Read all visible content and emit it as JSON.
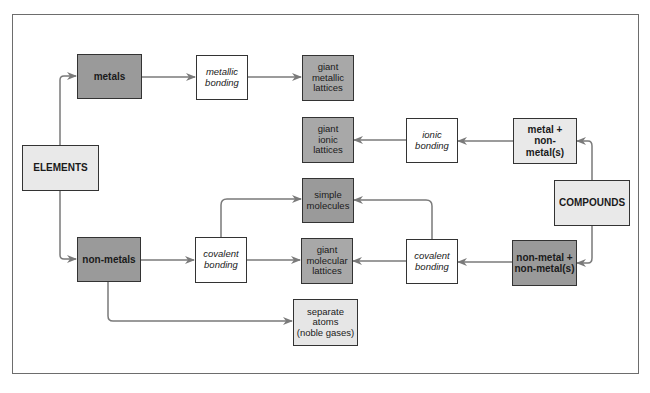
{
  "diagram": {
    "nodes": {
      "elements": {
        "label": "ELEMENTS",
        "style": "bold-caps"
      },
      "compounds": {
        "label": "COMPOUNDS",
        "style": "bold-caps"
      },
      "metals": {
        "label": "metals"
      },
      "non_metals": {
        "label": "non-metals"
      },
      "metallic_bonding": {
        "line1": "metallic",
        "line2": "bonding"
      },
      "giant_metallic_lattices": {
        "line1": "giant",
        "line2": "metallic",
        "line3": "lattices"
      },
      "giant_ionic_lattices": {
        "line1": "giant",
        "line2": "ionic",
        "line3": "lattices"
      },
      "ionic_bonding": {
        "line1": "ionic",
        "line2": "bonding"
      },
      "metal_nonmetal": {
        "line1": "metal +",
        "line2": "non-",
        "line3": "metal(s)"
      },
      "simple_molecules": {
        "line1": "simple",
        "line2": "molecules"
      },
      "covalent_bonding_left": {
        "line1": "covalent",
        "line2": "bonding"
      },
      "giant_molecular_lattices": {
        "line1": "giant",
        "line2": "molecular",
        "line3": "lattices"
      },
      "covalent_bonding_right": {
        "line1": "covalent",
        "line2": "bonding"
      },
      "nonmetal_nonmetal": {
        "line1": "non-metal +",
        "line2": "non-metal(s)"
      },
      "separate_atoms": {
        "line1": "separate",
        "line2": "atoms",
        "line3": "(noble gases)"
      }
    },
    "edges": [
      {
        "from": "ELEMENTS",
        "to": "metals"
      },
      {
        "from": "ELEMENTS",
        "to": "non-metals"
      },
      {
        "from": "metals",
        "to": "metallic bonding"
      },
      {
        "from": "metallic bonding",
        "to": "giant metallic lattices"
      },
      {
        "from": "COMPOUNDS",
        "to": "metal + non-metal(s)"
      },
      {
        "from": "COMPOUNDS",
        "to": "non-metal + non-metal(s)"
      },
      {
        "from": "metal + non-metal(s)",
        "to": "ionic bonding"
      },
      {
        "from": "ionic bonding",
        "to": "giant ionic lattices"
      },
      {
        "from": "non-metals",
        "to": "covalent bonding"
      },
      {
        "from": "covalent bonding",
        "to": "simple molecules"
      },
      {
        "from": "covalent bonding",
        "to": "giant molecular lattices"
      },
      {
        "from": "non-metal + non-metal(s)",
        "to": "covalent bonding"
      },
      {
        "from": "covalent bonding (right)",
        "to": "simple molecules"
      },
      {
        "from": "covalent bonding (right)",
        "to": "giant molecular lattices"
      },
      {
        "from": "non-metals",
        "to": "separate atoms (noble gases)"
      }
    ],
    "colors": {
      "arrow": "#7a7a7a",
      "border": "#333333",
      "dark_fill": "#9a9a9a",
      "mid_fill": "#a8a8a8",
      "light_fill": "#e9e9e9"
    }
  }
}
